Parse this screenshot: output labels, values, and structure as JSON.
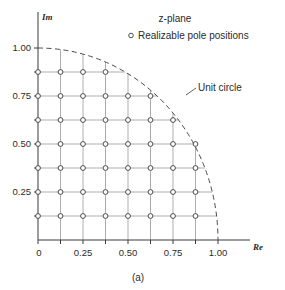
{
  "chart_data": {
    "type": "scatter",
    "title": "z-plane",
    "legend_label": "Realizable pole positions",
    "legend_marker": "o",
    "annotation": "Unit circle",
    "figure_caption": "(a)",
    "xlabel": "Re",
    "ylabel": "Im",
    "xlim": [
      0,
      1.125
    ],
    "ylim": [
      0,
      1.08
    ],
    "grid": true,
    "grid_step": 0.125,
    "legend_position": "top-right",
    "xticks": [
      0,
      0.125,
      0.25,
      0.375,
      0.5,
      0.625,
      0.75,
      0.875,
      1.0
    ],
    "xtick_labels": [
      "0",
      "",
      "0.25",
      "",
      "0.50",
      "",
      "0.75",
      "",
      "1.00"
    ],
    "yticks": [
      0,
      0.125,
      0.25,
      0.375,
      0.5,
      0.625,
      0.75,
      0.875,
      1.0
    ],
    "ytick_labels": [
      "",
      "",
      "0.25",
      "",
      "0.50",
      "",
      "0.75",
      "",
      "1.00"
    ],
    "unit_circle_radius": 1.0,
    "points": [
      [
        0,
        0.125
      ],
      [
        0,
        0.25
      ],
      [
        0,
        0.375
      ],
      [
        0,
        0.5
      ],
      [
        0,
        0.625
      ],
      [
        0,
        0.75
      ],
      [
        0,
        0.875
      ],
      [
        0.125,
        0.125
      ],
      [
        0.125,
        0.25
      ],
      [
        0.125,
        0.375
      ],
      [
        0.125,
        0.5
      ],
      [
        0.125,
        0.625
      ],
      [
        0.125,
        0.75
      ],
      [
        0.125,
        0.875
      ],
      [
        0.25,
        0.125
      ],
      [
        0.25,
        0.25
      ],
      [
        0.25,
        0.375
      ],
      [
        0.25,
        0.5
      ],
      [
        0.25,
        0.625
      ],
      [
        0.25,
        0.75
      ],
      [
        0.25,
        0.875
      ],
      [
        0.375,
        0.125
      ],
      [
        0.375,
        0.25
      ],
      [
        0.375,
        0.375
      ],
      [
        0.375,
        0.5
      ],
      [
        0.375,
        0.625
      ],
      [
        0.375,
        0.75
      ],
      [
        0.375,
        0.875
      ],
      [
        0.5,
        0.125
      ],
      [
        0.5,
        0.25
      ],
      [
        0.5,
        0.375
      ],
      [
        0.5,
        0.5
      ],
      [
        0.5,
        0.625
      ],
      [
        0.5,
        0.75
      ],
      [
        0.625,
        0.125
      ],
      [
        0.625,
        0.25
      ],
      [
        0.625,
        0.375
      ],
      [
        0.625,
        0.5
      ],
      [
        0.625,
        0.625
      ],
      [
        0.625,
        0.75
      ],
      [
        0.75,
        0.125
      ],
      [
        0.75,
        0.25
      ],
      [
        0.75,
        0.375
      ],
      [
        0.75,
        0.5
      ],
      [
        0.75,
        0.625
      ],
      [
        0.875,
        0.125
      ],
      [
        0.875,
        0.25
      ],
      [
        0.875,
        0.375
      ],
      [
        0.875,
        0.5
      ]
    ]
  },
  "header": {
    "title": "z-plane",
    "legend": "Realizable pole positions"
  },
  "labels": {
    "unit_circle": "Unit circle",
    "caption": "(a)",
    "axis_x": "Re",
    "axis_y": "Im"
  },
  "colors": {
    "axis": "#3a3a3a",
    "grid": "#8a8a8a",
    "circle": "#4a4a4a",
    "text": "#2b2b2b",
    "background": "#ffffff"
  }
}
